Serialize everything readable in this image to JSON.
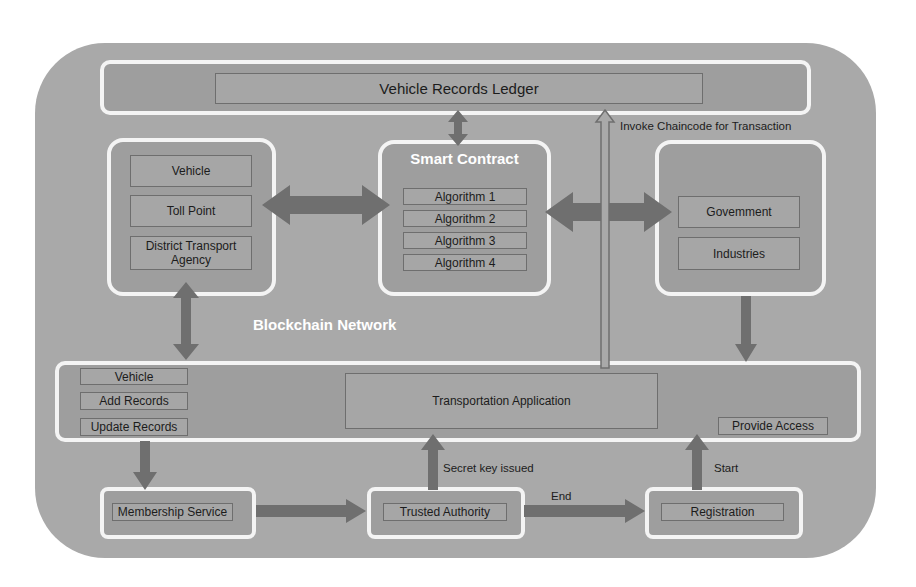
{
  "ledger": {
    "title": "Vehicle Records Ledger"
  },
  "invoke_label": "Invoke Chaincode for Transaction",
  "left_panel": {
    "items": [
      "Vehicle",
      "Toll Point",
      "District Transport Agency"
    ]
  },
  "smart_contract": {
    "title": "Smart Contract",
    "algorithms": [
      "Algorithm 1",
      "Algorithm 2",
      "Algorithm 3",
      "Algorithm 4"
    ]
  },
  "right_panel": {
    "items": [
      "Govemment",
      "Industries"
    ]
  },
  "network_label": "Blockchain Network",
  "app_bar": {
    "left_items": [
      "Vehicle",
      "Add Records",
      "Update Records"
    ],
    "center": "Transportation Application",
    "right": "Provide Access"
  },
  "bottom_flow": {
    "membership": "Membership Service",
    "trusted": "Trusted Authority",
    "registration": "Registration",
    "secret_label": "Secret key issued",
    "end_label": "End",
    "start_label": "Start"
  },
  "colors": {
    "background": "#a9a9a9",
    "panel_border": "#f4f4f4",
    "arrow": "#6f6f6f",
    "text_white": "#ffffff"
  }
}
